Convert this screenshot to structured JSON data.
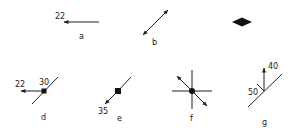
{
  "diagram": {
    "stroke_color": "#222222",
    "background": "#ffffff",
    "figures": [
      {
        "id": "a",
        "label": "a",
        "value_labels": [
          "22"
        ],
        "description": "Single arrow pointing left"
      },
      {
        "id": "b",
        "label": "b",
        "value_labels": [],
        "description": "Double-headed diagonal arrow"
      },
      {
        "id": "c",
        "label": "",
        "value_labels": [],
        "description": "Filled diamond symbol"
      },
      {
        "id": "d",
        "label": "d",
        "value_labels": [
          "22",
          "30"
        ],
        "description": "Diagonal line with point and arrow pointing left"
      },
      {
        "id": "e",
        "label": "e",
        "value_labels": [
          "35"
        ],
        "description": "Diagonal line with square point and arrow toward lower-left"
      },
      {
        "id": "f",
        "label": "f",
        "value_labels": [],
        "description": "Crossing vertical and horizontal lines with diagonal double arrow and center dot"
      },
      {
        "id": "g",
        "label": "g",
        "value_labels": [
          "40",
          "50"
        ],
        "description": "Diagonal line with upward arrow and tick"
      }
    ]
  }
}
